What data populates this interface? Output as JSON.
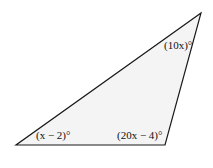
{
  "diagram": {
    "shape": "triangle",
    "fill": "#f4f4f4",
    "stroke": "#1a1a1a",
    "vertices": {
      "bottom_left": [
        16,
        145
      ],
      "bottom_right": [
        165,
        145
      ],
      "top_right": [
        201,
        13
      ]
    },
    "angles": {
      "bottom_left": "(x − 2)°",
      "bottom_right": "(20x − 4)°",
      "top_right": "(10x)°"
    }
  }
}
